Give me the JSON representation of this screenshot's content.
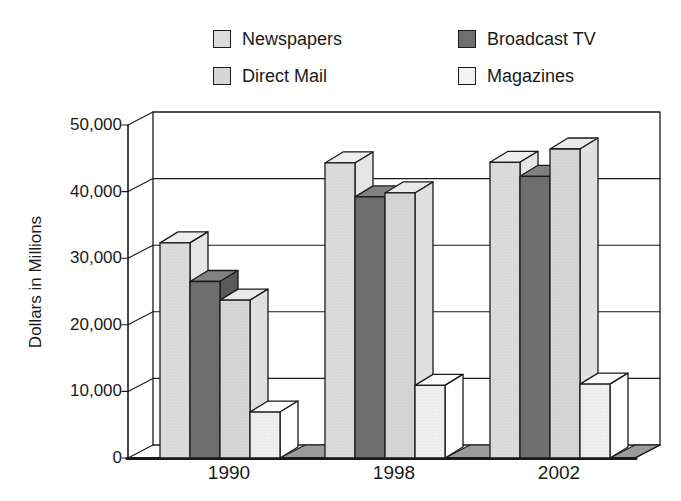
{
  "legend": {
    "items": [
      {
        "label": "Newspapers",
        "color": "#dcdcdc"
      },
      {
        "label": "Broadcast TV",
        "color": "#6f6f6f"
      },
      {
        "label": "Direct Mail",
        "color": "#d6d6d6"
      },
      {
        "label": "Magazines",
        "color": "#f2f2f2"
      }
    ]
  },
  "chart_data": {
    "type": "bar",
    "projection": "3d",
    "title": "",
    "ylabel": "Dollars in Millions",
    "xlabel": "",
    "categories": [
      "1990",
      "1998",
      "2002"
    ],
    "series": [
      {
        "name": "Newspapers",
        "values": [
          32300,
          44300,
          44400
        ],
        "front": "#dcdcdc",
        "top": "#eeeeee",
        "side": "#e6e6e6"
      },
      {
        "name": "Broadcast TV",
        "values": [
          26500,
          39200,
          42300
        ],
        "front": "#6f6f6f",
        "top": "#818181",
        "side": "#5a5a5a"
      },
      {
        "name": "Direct Mail",
        "values": [
          23700,
          39800,
          46400
        ],
        "front": "#d6d6d6",
        "top": "#eaeaea",
        "side": "#e0e0e0"
      },
      {
        "name": "Magazines",
        "values": [
          6900,
          10900,
          11100
        ],
        "front": "#f0f0f0",
        "top": "#fafafa",
        "side": "#ffffff"
      }
    ],
    "yticks": [
      "0",
      "10,000",
      "20,000",
      "30,000",
      "40,000",
      "50,000"
    ],
    "ylim": [
      0,
      50000
    ],
    "grid": "horizontal",
    "legend_position": "top",
    "floor_color": "#9b9b9b",
    "outline_color": "#1a1a1a",
    "background_color": "#ffffff"
  }
}
